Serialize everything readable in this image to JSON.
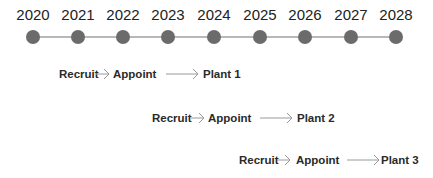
{
  "timeline": {
    "years": [
      "2020",
      "2021",
      "2022",
      "2023",
      "2024",
      "2025",
      "2026",
      "2027",
      "2028"
    ],
    "dot_color": "#6b6b6b",
    "line_color": "#b8b8b8"
  },
  "rows": [
    {
      "steps": [
        "Recruit",
        "Appoint",
        "Plant 1"
      ]
    },
    {
      "steps": [
        "Recruit",
        "Appoint",
        "Plant 2"
      ]
    },
    {
      "steps": [
        "Recruit",
        "Appoint",
        "Plant 3"
      ]
    }
  ]
}
